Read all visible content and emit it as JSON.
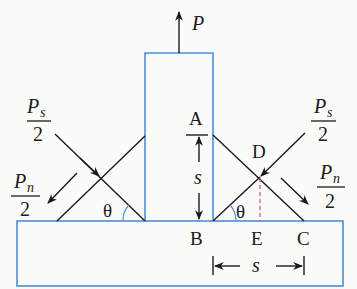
{
  "diagram": {
    "type": "fillet-weld-free-body",
    "colors": {
      "plate_outline": "#4a8fd6",
      "weld_line": "#1a1a1a",
      "hidden_line": "#d9536f",
      "angle_arc": "#4a8fd6"
    },
    "labels": {
      "load": "P",
      "point_a": "A",
      "point_b": "B",
      "point_c": "C",
      "point_d": "D",
      "point_e": "E",
      "angle_left": "θ",
      "angle_right": "θ",
      "dim_vertical": "s",
      "dim_horizontal": "s",
      "shear_left": {
        "num_main": "P",
        "num_sub": "s",
        "den": "2"
      },
      "normal_left": {
        "num_main": "P",
        "num_sub": "n",
        "den": "2"
      },
      "shear_right": {
        "num_main": "P",
        "num_sub": "s",
        "den": "2"
      },
      "normal_right": {
        "num_main": "P",
        "num_sub": "n",
        "den": "2"
      }
    }
  }
}
